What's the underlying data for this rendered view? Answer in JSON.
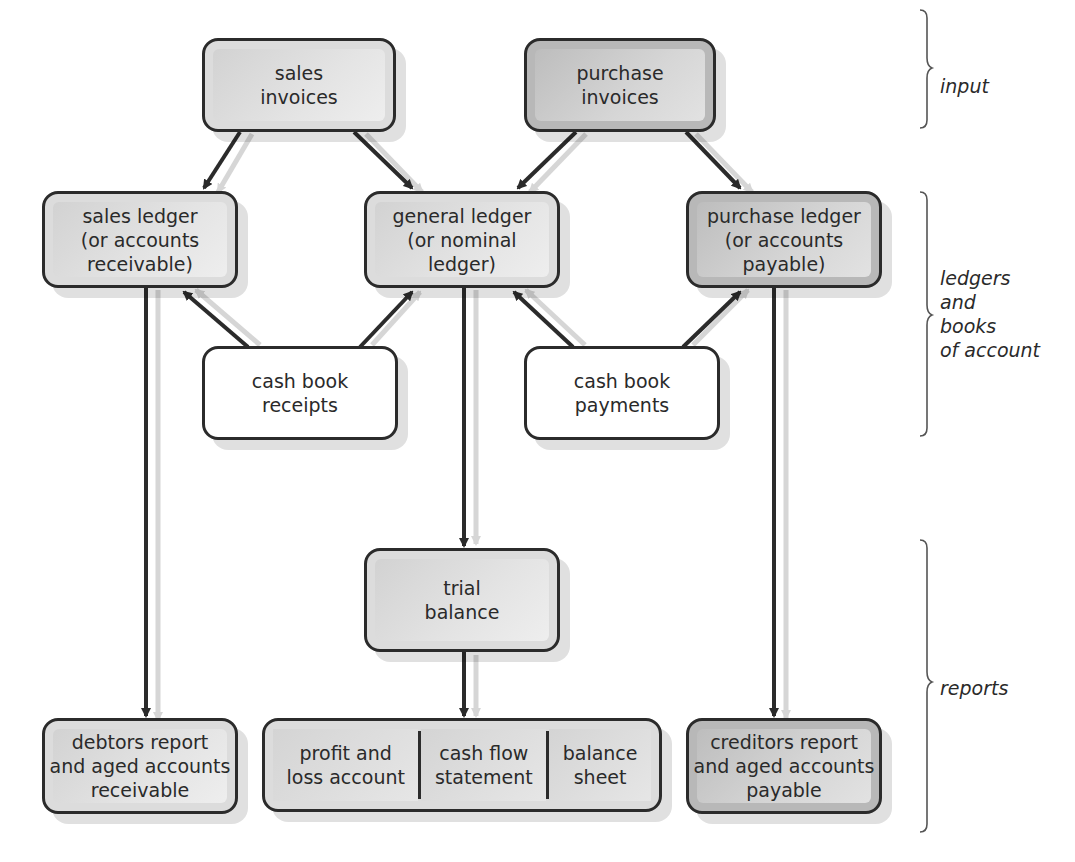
{
  "diagram": {
    "nodes": {
      "sales_invoices": "sales\ninvoices",
      "purchase_invoices": "purchase\ninvoices",
      "sales_ledger": "sales ledger\n(or accounts\nreceivable)",
      "general_ledger": "general ledger\n(or nominal\nledger)",
      "purchase_ledger": "purchase ledger\n(or accounts\npayable)",
      "cash_book_receipts": "cash book\nreceipts",
      "cash_book_payments": "cash book\npayments",
      "trial_balance": "trial\nbalance",
      "debtors_report": "debtors report\nand aged accounts\nreceivable",
      "financial_statements": [
        "profit and\nloss account",
        "cash flow\nstatement",
        "balance\nsheet"
      ],
      "creditors_report": "creditors report\nand aged accounts\npayable"
    },
    "sections": {
      "input": "input",
      "ledgers": "ledgers\nand\nbooks\nof account",
      "reports": "reports"
    },
    "edges": [
      {
        "from": "sales invoices",
        "to": "sales ledger"
      },
      {
        "from": "sales invoices",
        "to": "general ledger"
      },
      {
        "from": "purchase invoices",
        "to": "general ledger"
      },
      {
        "from": "purchase invoices",
        "to": "purchase ledger"
      },
      {
        "from": "cash book receipts",
        "to": "sales ledger"
      },
      {
        "from": "cash book receipts",
        "to": "general ledger"
      },
      {
        "from": "cash book payments",
        "to": "general ledger"
      },
      {
        "from": "cash book payments",
        "to": "purchase ledger"
      },
      {
        "from": "sales ledger",
        "to": "debtors report and aged accounts receivable"
      },
      {
        "from": "general ledger",
        "to": "trial balance"
      },
      {
        "from": "trial balance",
        "to": "financial statements"
      },
      {
        "from": "purchase ledger",
        "to": "creditors report and aged accounts payable"
      }
    ],
    "colors": {
      "stroke": "#2b2b2b",
      "fill_light": "#dcdcdc",
      "fill_dark": "#b8b8b8",
      "shadow_arrow": "#d8d8d8"
    }
  }
}
